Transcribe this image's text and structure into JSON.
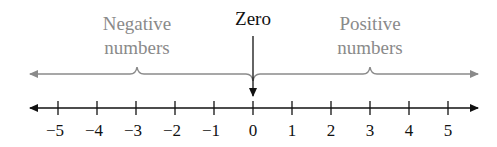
{
  "diagram": {
    "zero_label": "Zero",
    "negative_label": [
      "Negative",
      "numbers"
    ],
    "positive_label": [
      "Positive",
      "numbers"
    ],
    "ticks": [
      "−5",
      "−4",
      "−3",
      "−2",
      "−1",
      "0",
      "1",
      "2",
      "3",
      "4",
      "5"
    ],
    "tick_values": [
      -5,
      -4,
      -3,
      -2,
      -1,
      0,
      1,
      2,
      3,
      4,
      5
    ],
    "colors": {
      "axis": "#111111",
      "bracket": "#8a8a8a",
      "label_gray": "#8a8a8a",
      "zero_label": "#111111"
    }
  }
}
